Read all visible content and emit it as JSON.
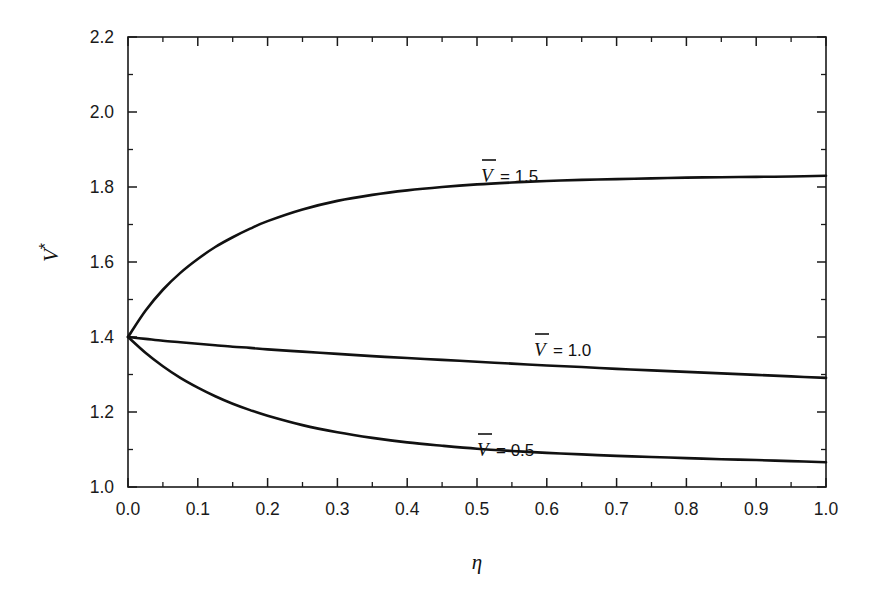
{
  "chart_data": {
    "type": "line",
    "title": "",
    "subtitle": "",
    "xlabel": "η",
    "ylabel": "V*",
    "xlim": [
      0.0,
      1.0
    ],
    "ylim": [
      1.0,
      2.2
    ],
    "grid": false,
    "legend_position": "inline-annotations",
    "x_ticks": [
      "0.0",
      "0.1",
      "0.2",
      "0.3",
      "0.4",
      "0.5",
      "0.6",
      "0.7",
      "0.8",
      "0.9",
      "1.0"
    ],
    "x_tick_values": [
      0.0,
      0.1,
      0.2,
      0.3,
      0.4,
      0.5,
      0.6,
      0.7,
      0.8,
      0.9,
      1.0
    ],
    "x_minor_step": 0.05,
    "y_ticks": [
      "1.0",
      "1.2",
      "1.4",
      "1.6",
      "1.8",
      "2.0",
      "2.2"
    ],
    "y_tick_values": [
      1.0,
      1.2,
      1.4,
      1.6,
      1.8,
      2.0,
      2.2
    ],
    "y_minor_step": 0.1,
    "x": [
      0.0,
      0.025,
      0.05,
      0.075,
      0.1,
      0.125,
      0.15,
      0.175,
      0.2,
      0.25,
      0.3,
      0.35,
      0.4,
      0.45,
      0.5,
      0.55,
      0.6,
      0.65,
      0.7,
      0.75,
      0.8,
      0.85,
      0.9,
      0.95,
      1.0
    ],
    "series": [
      {
        "name": "Vbar = 1.5",
        "label": "V̄ = 1.5",
        "label_var": "V",
        "label_rest": " = 1.5",
        "values": [
          1.4,
          1.47,
          1.526,
          1.571,
          1.608,
          1.64,
          1.666,
          1.689,
          1.709,
          1.74,
          1.763,
          1.779,
          1.791,
          1.8,
          1.807,
          1.812,
          1.816,
          1.819,
          1.821,
          1.823,
          1.825,
          1.826,
          1.827,
          1.828,
          1.83
        ]
      },
      {
        "name": "Vbar = 1.0",
        "label": "V̄ = 1.0",
        "label_var": "V",
        "label_rest": " = 1.0",
        "values": [
          1.4,
          1.395,
          1.39,
          1.386,
          1.382,
          1.378,
          1.374,
          1.371,
          1.367,
          1.361,
          1.355,
          1.349,
          1.344,
          1.339,
          1.334,
          1.329,
          1.324,
          1.32,
          1.315,
          1.311,
          1.307,
          1.303,
          1.299,
          1.295,
          1.291
        ]
      },
      {
        "name": "Vbar = 0.5",
        "label": "V̄ = 0.5",
        "label_var": "V",
        "label_rest": " = 0.5",
        "values": [
          1.4,
          1.358,
          1.322,
          1.291,
          1.265,
          1.242,
          1.222,
          1.205,
          1.19,
          1.165,
          1.146,
          1.131,
          1.119,
          1.11,
          1.102,
          1.096,
          1.091,
          1.087,
          1.083,
          1.08,
          1.077,
          1.074,
          1.072,
          1.069,
          1.066
        ]
      }
    ],
    "annotations": [
      {
        "text": "V̄ = 1.5",
        "x": 0.52,
        "y": 1.88
      },
      {
        "text": "V̄ = 1.0",
        "x": 0.65,
        "y": 1.42
      },
      {
        "text": "V̄ = 0.5",
        "x": 0.58,
        "y": 1.16
      }
    ],
    "colors": {
      "curve": "#111111",
      "axis": "#1a1a1a",
      "background": "#ffffff"
    }
  },
  "axis_labels": {
    "y_base": "V",
    "y_superscript": "*",
    "x": "η"
  },
  "curve_labels": {
    "top": {
      "var": "V",
      "rest": "= 1.5"
    },
    "middle": {
      "var": "V",
      "rest": "= 1.0"
    },
    "bottom": {
      "var": "V",
      "rest": "= 0.5"
    }
  },
  "ticks": {
    "x": [
      "0.0",
      "0.1",
      "0.2",
      "0.3",
      "0.4",
      "0.5",
      "0.6",
      "0.7",
      "0.8",
      "0.9",
      "1.0"
    ],
    "y": [
      "1.0",
      "1.2",
      "1.4",
      "1.6",
      "1.8",
      "2.0",
      "2.2"
    ]
  }
}
